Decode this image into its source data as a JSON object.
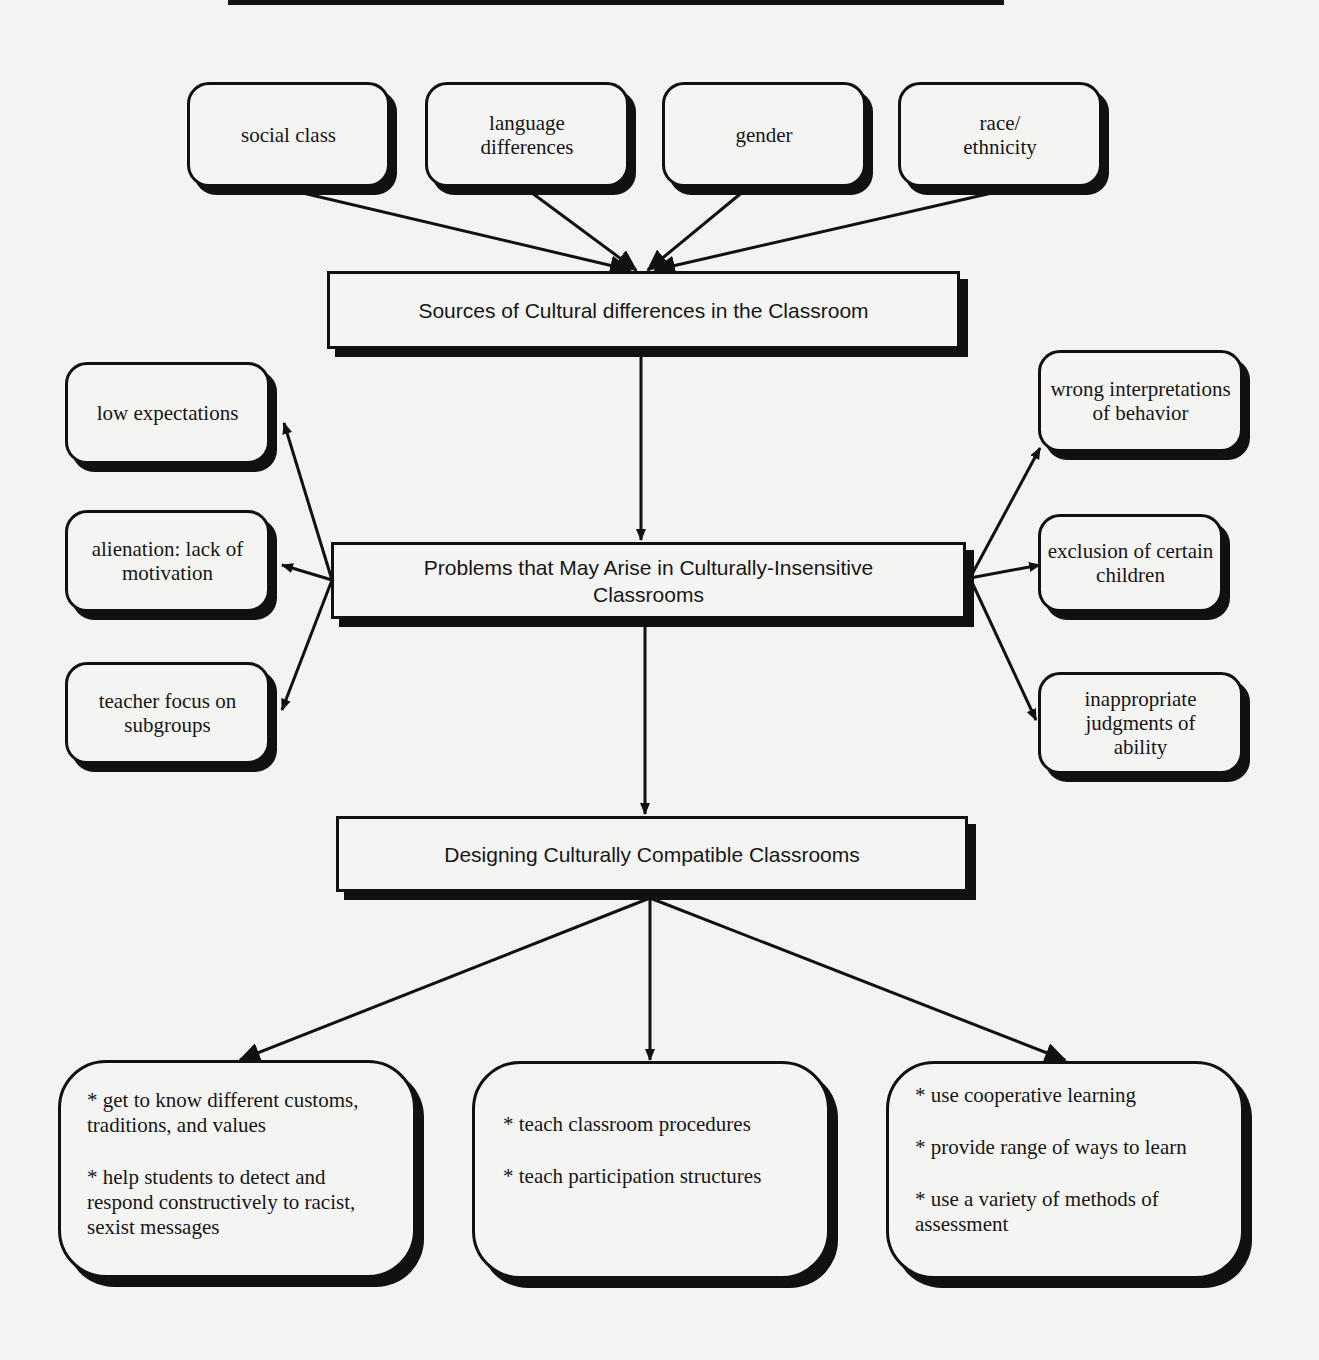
{
  "diagram": {
    "sources_nodes": [
      {
        "label": "social class"
      },
      {
        "label": "language\ndifferences"
      },
      {
        "label": "gender"
      },
      {
        "label": "race/\nethnicity"
      }
    ],
    "sources_box": {
      "label": "Sources of Cultural differences in the Classroom"
    },
    "problems_box": {
      "label": "Problems that May Arise in Culturally-Insensitive Classrooms"
    },
    "problems_left": [
      {
        "label": "low expectations"
      },
      {
        "label": "alienation:  lack of motivation"
      },
      {
        "label": "teacher focus on subgroups"
      }
    ],
    "problems_right": [
      {
        "label": "wrong interpretations of behavior"
      },
      {
        "label": "exclusion of certain children"
      },
      {
        "label": "inappropriate judgments  of ability"
      }
    ],
    "design_box": {
      "label": "Designing Culturally Compatible Classrooms"
    },
    "strategies": [
      {
        "items": [
          "*  get to know different customs, traditions, and values",
          "* help students to detect and respond constructively to racist, sexist messages"
        ]
      },
      {
        "items": [
          "* teach classroom procedures",
          "* teach participation structures"
        ]
      },
      {
        "items": [
          "*  use cooperative learning",
          "* provide range of ways to learn",
          "* use a variety of methods of assessment"
        ]
      }
    ]
  }
}
